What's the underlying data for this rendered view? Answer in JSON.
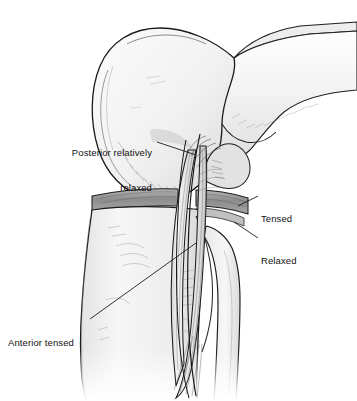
{
  "figure": {
    "background_color": "#ffffff",
    "outline_color": "#1a1a1a",
    "bone_fill_color": "#f4f4f4",
    "shadow_color": "#cfcfcf",
    "meniscus_color": "#9a9a9a",
    "ligament_color": "#e8e8e8",
    "label_color": "#111111"
  },
  "labels": [
    {
      "id": "posterior-relaxed",
      "line1": "Posterior relatively",
      "line2": "relaxed",
      "align": "right",
      "x": 36,
      "y": 124,
      "width": 116,
      "leader": {
        "x1": 157,
        "y1": 142,
        "x2": 196,
        "y2": 155
      }
    },
    {
      "id": "tensed",
      "line1": "Tensed",
      "line2": "",
      "align": "left",
      "x": 261,
      "y": 190,
      "width": 60,
      "leader": {
        "x1": 258,
        "y1": 196,
        "x2": 238,
        "y2": 206
      }
    },
    {
      "id": "relaxed",
      "line1": "Relaxed",
      "line2": "",
      "align": "left",
      "x": 261,
      "y": 232,
      "width": 60,
      "leader": {
        "x1": 258,
        "y1": 238,
        "x2": 234,
        "y2": 222
      }
    },
    {
      "id": "anterior-tensed",
      "line1": "Anterior tensed",
      "line2": "",
      "align": "left",
      "x": 8,
      "y": 314,
      "width": 84,
      "leader": {
        "x1": 90,
        "y1": 319,
        "x2": 196,
        "y2": 243
      }
    }
  ],
  "anatomy": {
    "parts": [
      {
        "name": "femur-condyle",
        "label": "Distal femur / lateral condyle"
      },
      {
        "name": "femur-shaft",
        "label": "Femoral shaft"
      },
      {
        "name": "intercondylar-notch",
        "label": "Intercondylar notch"
      },
      {
        "name": "meniscus-band",
        "label": "Meniscus / tibial plateau band"
      },
      {
        "name": "tibia",
        "label": "Proximal tibia"
      },
      {
        "name": "fibula",
        "label": "Fibular head and shaft"
      },
      {
        "name": "ligament-bundle-anterior",
        "label": "Anterior ligament fiber bundle"
      },
      {
        "name": "ligament-bundle-posterior",
        "label": "Posterior ligament fiber bundle"
      }
    ]
  }
}
